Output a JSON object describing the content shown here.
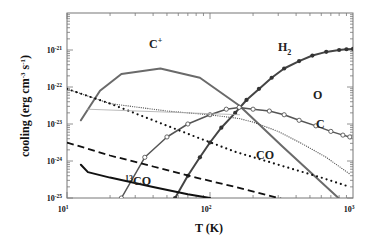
{
  "chart_data": {
    "type": "line",
    "title": "",
    "xlabel": "T  (K)",
    "ylabel": "cooling  (erg cm^-3 s^-1)",
    "xscale": "log",
    "yscale": "log",
    "xlim": [
      10,
      1000
    ],
    "ylim": [
      1e-25,
      1e-20
    ],
    "x_ticks": [
      {
        "base": "10",
        "exp": "1",
        "value": 10
      },
      {
        "base": "10",
        "exp": "2",
        "value": 100
      },
      {
        "base": "10",
        "exp": "3",
        "value": 1000
      }
    ],
    "y_ticks": [
      {
        "base": "10",
        "exp": "-21",
        "value": 1e-21
      },
      {
        "base": "10",
        "exp": "-22",
        "value": 1e-22
      },
      {
        "base": "10",
        "exp": "-23",
        "value": 1e-23
      },
      {
        "base": "10",
        "exp": "-24",
        "value": 1e-24
      },
      {
        "base": "10",
        "exp": "-25",
        "value": 1e-25
      }
    ],
    "grid": false,
    "legend": "inline labels",
    "series": [
      {
        "name": "C+",
        "label": "C",
        "label_sup": "+",
        "style": "solid",
        "color": "#6a6a6a",
        "marker": "none",
        "x": [
          12.5,
          17,
          24,
          45,
          85,
          160,
          320,
          900
        ],
        "y_log10": [
          -22.9,
          -22.1,
          -21.65,
          -21.5,
          -21.75,
          -22.5,
          -23.6,
          -25.2
        ],
        "label_pos": [
          149,
          48
        ]
      },
      {
        "name": "H2",
        "label": "H",
        "label_sub": "2",
        "style": "solid",
        "color": "#444444",
        "marker": "filled-circle",
        "x": [
          57,
          70,
          85,
          100,
          120,
          150,
          180,
          220,
          270,
          330,
          420,
          520,
          650,
          800,
          900,
          1000
        ],
        "y_log10": [
          -25.0,
          -24.4,
          -23.9,
          -23.5,
          -23.1,
          -22.7,
          -22.35,
          -22.05,
          -21.75,
          -21.5,
          -21.3,
          -21.15,
          -21.05,
          -21.0,
          -20.98,
          -20.97
        ],
        "label_pos": [
          278,
          51
        ]
      },
      {
        "name": "O",
        "label": "O",
        "style": "solid",
        "color": "#555555",
        "marker": "open-circle",
        "x": [
          24,
          35,
          50,
          70,
          100,
          130,
          160,
          200,
          260,
          330,
          420,
          550,
          700,
          850,
          950
        ],
        "y_log10": [
          -25.0,
          -23.9,
          -23.35,
          -23.0,
          -22.75,
          -22.6,
          -22.55,
          -22.6,
          -22.65,
          -22.75,
          -22.9,
          -23.05,
          -23.2,
          -23.3,
          -23.35
        ],
        "label_pos": [
          313,
          99
        ]
      },
      {
        "name": "C",
        "label": "C",
        "style": "fine-dotted",
        "color": "#555555",
        "marker": "none",
        "x": [
          10,
          20,
          50,
          100,
          160,
          200,
          300,
          450,
          650,
          950
        ],
        "y_log10": [
          -22.05,
          -22.45,
          -22.65,
          -22.75,
          -22.85,
          -22.95,
          -23.2,
          -23.55,
          -23.9,
          -24.35
        ],
        "label_pos": [
          316,
          128
        ]
      },
      {
        "name": "CO",
        "label": "CO",
        "style": "dotted",
        "color": "#111111",
        "marker": "none",
        "x": [
          10,
          20,
          40,
          80,
          150,
          300,
          600,
          950
        ],
        "y_log10": [
          -22.05,
          -22.45,
          -22.9,
          -23.35,
          -23.75,
          -24.1,
          -24.45,
          -24.7
        ],
        "label_pos": [
          256,
          159
        ]
      },
      {
        "name": "13CO",
        "label": "CO",
        "label_pre_sup": "13",
        "style": "dashed",
        "color": "#111111",
        "marker": "none",
        "x": [
          10,
          20,
          40,
          80,
          150,
          300,
          420
        ],
        "y_log10": [
          -23.5,
          -23.85,
          -24.15,
          -24.45,
          -24.7,
          -25.0,
          -25.15
        ],
        "label_pos": [
          125,
          185
        ]
      },
      {
        "name": "lowest-solid",
        "label": "",
        "style": "solid",
        "color": "#111111",
        "marker": "none",
        "x": [
          12.5,
          14,
          20,
          40,
          70,
          100
        ],
        "y_log10": [
          -24.1,
          -24.3,
          -24.45,
          -24.7,
          -24.9,
          -25.0
        ]
      }
    ],
    "annotations": [
      {
        "text": "C+",
        "series": "C+"
      },
      {
        "text": "H2",
        "series": "H2"
      },
      {
        "text": "O",
        "series": "O"
      },
      {
        "text": "C",
        "series": "C"
      },
      {
        "text": "CO",
        "series": "CO"
      },
      {
        "text": "13CO",
        "series": "13CO"
      }
    ]
  },
  "axes": {
    "xlabel": "T  (K)",
    "ylabel_main": "cooling  (erg cm",
    "ylabel_sup1": "-3",
    "ylabel_mid": " s",
    "ylabel_sup2": "-1",
    "ylabel_end": ")"
  }
}
